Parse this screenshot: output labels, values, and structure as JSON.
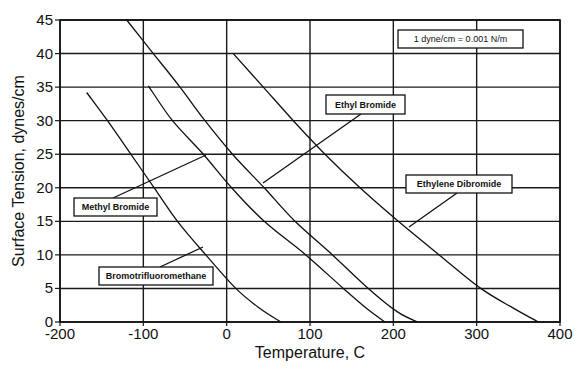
{
  "chart_data": {
    "type": "line",
    "title": "",
    "xlabel": "Temperature, C",
    "ylabel": "Surface Tension,  dynes/cm",
    "xlim": [
      -200,
      400
    ],
    "ylim": [
      0,
      45
    ],
    "xticks": [
      -200,
      -100,
      0,
      100,
      200,
      300,
      400
    ],
    "yticks": [
      0,
      5,
      10,
      15,
      20,
      25,
      30,
      35,
      40,
      45
    ],
    "grid": true,
    "legend": "callout labels on plot",
    "note": "1 dyne/cm = 0.001 N/m",
    "series": [
      {
        "name": "Bromotrifluoromethane",
        "points": [
          [
            -168,
            34.2
          ],
          [
            -143,
            30
          ],
          [
            -115,
            25
          ],
          [
            -87,
            20
          ],
          [
            -59,
            15
          ],
          [
            -25,
            10
          ],
          [
            11,
            5
          ],
          [
            40,
            2
          ],
          [
            65,
            0
          ]
        ],
        "label_box": {
          "x": 99,
          "y": 267,
          "w": 114,
          "h": 18
        },
        "leader": [
          [
            160,
            267
          ],
          [
            203,
            247
          ]
        ]
      },
      {
        "name": "Methyl Bromide",
        "points": [
          [
            -94,
            35.2
          ],
          [
            -65,
            30
          ],
          [
            -28,
            25
          ],
          [
            6,
            20
          ],
          [
            45,
            15
          ],
          [
            95,
            10
          ],
          [
            140,
            5
          ],
          [
            168,
            2
          ],
          [
            190,
            0
          ]
        ],
        "label_box": {
          "x": 74,
          "y": 198,
          "w": 83,
          "h": 18
        },
        "leader": [
          [
            113,
            198
          ],
          [
            206,
            155
          ]
        ]
      },
      {
        "name": "Ethyl Bromide",
        "points": [
          [
            -120,
            45
          ],
          [
            -88,
            40
          ],
          [
            -56,
            35
          ],
          [
            -26,
            30
          ],
          [
            7,
            25
          ],
          [
            45,
            20
          ],
          [
            82,
            15
          ],
          [
            127,
            10
          ],
          [
            170,
            5
          ],
          [
            205,
            1.5
          ],
          [
            229,
            0
          ]
        ],
        "label_box": {
          "x": 326,
          "y": 95,
          "w": 79,
          "h": 19
        },
        "leader": [
          [
            361,
            114
          ],
          [
            263,
            183
          ]
        ]
      },
      {
        "name": "Ethylene Dibromide",
        "points": [
          [
            8,
            40
          ],
          [
            44,
            35
          ],
          [
            80,
            30
          ],
          [
            118,
            25
          ],
          [
            160,
            20
          ],
          [
            206,
            15
          ],
          [
            255,
            10
          ],
          [
            305,
            5
          ],
          [
            345,
            2
          ],
          [
            374,
            0
          ]
        ],
        "label_box": {
          "x": 406,
          "y": 175,
          "w": 106,
          "h": 18
        },
        "leader": [
          [
            457,
            193
          ],
          [
            409,
            227
          ]
        ]
      }
    ]
  },
  "note_box": {
    "text": "1 dyne/cm = 0.001 N/m",
    "x": 398,
    "y": 30,
    "w": 125,
    "h": 18
  },
  "plot_area": {
    "left": 60,
    "right": 560,
    "top": 20,
    "bottom": 322
  }
}
